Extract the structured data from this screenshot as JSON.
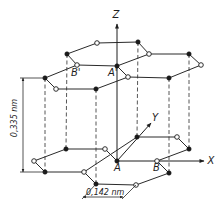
{
  "diagram": {
    "colors": {
      "line": "#2a2a2a",
      "atom_filled": "#1a1a1a",
      "atom_open": "#ffffff",
      "background": "#ffffff"
    },
    "axes": {
      "z": {
        "label": "Z",
        "from": [
          117,
          161
        ],
        "to": [
          117,
          24
        ],
        "label_pos": [
          116,
          18
        ]
      },
      "x": {
        "label": "X",
        "from": [
          117,
          161
        ],
        "to": [
          204,
          161
        ],
        "label_pos": [
          211,
          164
        ]
      },
      "y": {
        "label": "Y",
        "from": [
          117,
          161
        ],
        "to": [
          151,
          123
        ],
        "label_pos": [
          155,
          121
        ]
      }
    },
    "point_labels": [
      {
        "id": "A",
        "text": "A",
        "pos": [
          114,
          171
        ]
      },
      {
        "id": "B",
        "text": "B",
        "pos": [
          153,
          171
        ]
      },
      {
        "id": "A_prime",
        "text": "A'",
        "pos": [
          108,
          76
        ]
      },
      {
        "id": "B_prime",
        "text": "B'",
        "pos": [
          71,
          76
        ]
      }
    ],
    "upper_layer": {
      "atoms": [
        {
          "x": 97,
          "y": 43,
          "type": "open"
        },
        {
          "x": 138,
          "y": 42,
          "type": "filled"
        },
        {
          "x": 67,
          "y": 54,
          "type": "filled"
        },
        {
          "x": 149,
          "y": 54,
          "type": "open"
        },
        {
          "x": 189,
          "y": 54,
          "type": "filled"
        },
        {
          "x": 77,
          "y": 65,
          "type": "open"
        },
        {
          "x": 117,
          "y": 66,
          "type": "filled"
        },
        {
          "x": 201,
          "y": 65,
          "type": "open"
        },
        {
          "x": 45,
          "y": 78,
          "type": "filled"
        },
        {
          "x": 128,
          "y": 77,
          "type": "open"
        },
        {
          "x": 169,
          "y": 78,
          "type": "filled"
        },
        {
          "x": 56,
          "y": 89,
          "type": "open"
        },
        {
          "x": 96,
          "y": 89,
          "type": "filled"
        }
      ],
      "bonds": [
        [
          67,
          54,
          97,
          43
        ],
        [
          97,
          43,
          138,
          42
        ],
        [
          138,
          42,
          149,
          54
        ],
        [
          149,
          54,
          189,
          54
        ],
        [
          189,
          54,
          201,
          65
        ],
        [
          201,
          65,
          169,
          78
        ],
        [
          169,
          78,
          128,
          77
        ],
        [
          128,
          77,
          117,
          66
        ],
        [
          117,
          66,
          149,
          54
        ],
        [
          67,
          54,
          77,
          65
        ],
        [
          77,
          65,
          117,
          66
        ],
        [
          45,
          78,
          77,
          65
        ],
        [
          45,
          78,
          56,
          89
        ],
        [
          56,
          89,
          96,
          89
        ],
        [
          96,
          89,
          128,
          77
        ]
      ]
    },
    "lower_layer": {
      "atoms": [
        {
          "x": 66,
          "y": 149,
          "type": "filled"
        },
        {
          "x": 105,
          "y": 149,
          "type": "open"
        },
        {
          "x": 137,
          "y": 137,
          "type": "filled"
        },
        {
          "x": 177,
          "y": 137,
          "type": "open"
        },
        {
          "x": 189,
          "y": 149,
          "type": "filled"
        },
        {
          "x": 34,
          "y": 161,
          "type": "open"
        },
        {
          "x": 117,
          "y": 161,
          "type": "filled"
        },
        {
          "x": 157,
          "y": 161,
          "type": "open"
        },
        {
          "x": 45,
          "y": 172,
          "type": "filled"
        },
        {
          "x": 84,
          "y": 172,
          "type": "open"
        },
        {
          "x": 169,
          "y": 173,
          "type": "filled"
        },
        {
          "x": 96,
          "y": 184,
          "type": "filled"
        },
        {
          "x": 136,
          "y": 185,
          "type": "open"
        }
      ],
      "bonds": [
        [
          66,
          149,
          105,
          149
        ],
        [
          66,
          149,
          34,
          161
        ],
        [
          34,
          161,
          45,
          172
        ],
        [
          45,
          172,
          84,
          172
        ],
        [
          84,
          172,
          96,
          184
        ],
        [
          96,
          184,
          136,
          185
        ],
        [
          84,
          172,
          137,
          137
        ],
        [
          105,
          149,
          117,
          161
        ],
        [
          137,
          137,
          177,
          137
        ],
        [
          177,
          137,
          189,
          149
        ],
        [
          189,
          149,
          157,
          161
        ],
        [
          157,
          161,
          169,
          173
        ],
        [
          169,
          173,
          136,
          185
        ]
      ]
    },
    "projection_lines": [
      [
        45,
        78,
        45,
        172
      ],
      [
        67,
        54,
        66,
        149
      ],
      [
        96,
        89,
        96,
        184
      ],
      [
        138,
        42,
        137,
        137
      ],
      [
        169,
        78,
        169,
        173
      ],
      [
        189,
        54,
        189,
        149
      ]
    ],
    "dimensions": {
      "interlayer": {
        "label": "0,335 nm",
        "line": [
          23,
          78,
          23,
          172
        ],
        "ext_top": [
          20,
          78,
          45,
          78
        ],
        "ext_bottom": [
          20,
          172,
          45,
          172
        ],
        "label_pos": [
          17,
          118
        ]
      },
      "bond_length": {
        "label": "0,142 nm",
        "ext_left": [
          96,
          184,
          82,
          199
        ],
        "ext_right": [
          136,
          185,
          122,
          199
        ],
        "line": [
          83,
          197,
          123,
          197
        ],
        "label_pos": [
          86,
          195
        ]
      }
    }
  }
}
